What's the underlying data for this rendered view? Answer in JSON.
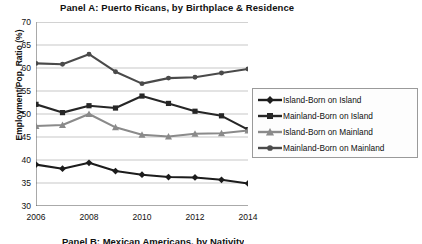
{
  "panel": {
    "title": "Panel A: Puerto Ricans, by Birthplace & Residence",
    "next_panel_partial": "Panel B: Mexican Americans, by Nativity"
  },
  "chart_data": {
    "type": "line",
    "title": "Panel A: Puerto Ricans, by Birthplace & Residence",
    "xlabel": "",
    "ylabel": "Employment/Pop. Ratio (%)",
    "x": [
      2006,
      2007,
      2008,
      2009,
      2010,
      2011,
      2012,
      2013,
      2014
    ],
    "xtick_labels": [
      "2006",
      "2008",
      "2010",
      "2012",
      "2014"
    ],
    "xtick_values": [
      2006,
      2008,
      2010,
      2012,
      2014
    ],
    "ytick_labels": [
      "30",
      "35",
      "40",
      "45",
      "50",
      "55",
      "60",
      "65",
      "70"
    ],
    "ylim": [
      30,
      70
    ],
    "ystep": 5,
    "grid": "horizontal",
    "legend_position": "right",
    "series": [
      {
        "name": "Island-Born on Island",
        "marker": "diamond",
        "color": "#1c1c1c",
        "values": [
          39.0,
          38.1,
          39.4,
          37.6,
          36.8,
          36.3,
          36.2,
          35.7,
          34.9
        ]
      },
      {
        "name": "Mainland-Born on Island",
        "marker": "square",
        "color": "#262626",
        "values": [
          52.1,
          50.3,
          51.8,
          51.3,
          53.9,
          52.3,
          50.6,
          49.6,
          46.6
        ]
      },
      {
        "name": "Island-Born on Mainland",
        "marker": "triangle",
        "color": "#8a8a8a",
        "values": [
          47.4,
          47.6,
          50.0,
          47.1,
          45.5,
          45.1,
          45.7,
          45.8,
          46.4
        ]
      },
      {
        "name": "Mainland-Born on Mainland",
        "marker": "circle",
        "color": "#4a4a4a",
        "values": [
          61.0,
          60.8,
          63.0,
          59.2,
          56.6,
          57.8,
          58.0,
          58.9,
          59.8
        ]
      }
    ]
  }
}
